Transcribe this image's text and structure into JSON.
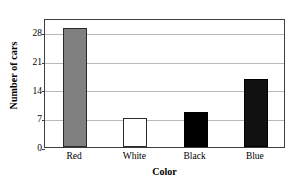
{
  "chart_data": {
    "type": "bar",
    "title": "",
    "xlabel": "Color",
    "ylabel": "Number of cars",
    "categories": [
      "Red",
      "White",
      "Black",
      "Blue"
    ],
    "values": [
      29,
      7,
      8.5,
      16.5
    ],
    "ylim": [
      0,
      31.5
    ],
    "yticks": [
      0,
      7,
      14,
      21,
      28
    ],
    "ytick_labels": [
      "0",
      "7",
      "14",
      "21",
      "28"
    ],
    "grid": true,
    "legend": "none",
    "bar_styles": [
      {
        "category": "Red",
        "fill": "#808080",
        "stroke": "#2a2a2a"
      },
      {
        "category": "White",
        "fill": "#ffffff",
        "stroke": "#2a2a2a"
      },
      {
        "category": "Black",
        "fill": "#000000",
        "stroke": "#000000"
      },
      {
        "category": "Blue",
        "fill": "#111111",
        "stroke": "#000000"
      }
    ],
    "colors": {
      "frame": "#3d3d3d",
      "gridline": "#b9b9b9",
      "background": "#ffffff",
      "text": "#000000"
    }
  }
}
